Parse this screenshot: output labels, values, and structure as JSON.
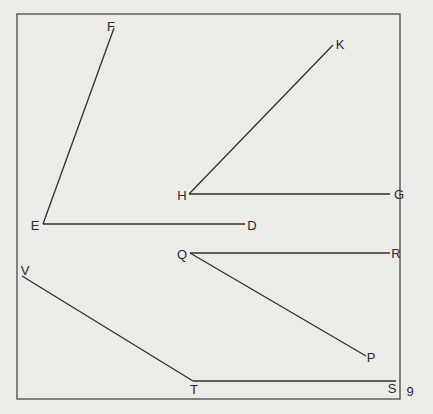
{
  "figure": {
    "page_number": "9",
    "frame": {
      "x1": 17,
      "y1": 14,
      "x2": 400,
      "y2": 399
    },
    "colors": {
      "background": "#ecebe8",
      "ink": "#2f2f2f",
      "frame": "#555555"
    },
    "angles": [
      {
        "name": "angle-FED",
        "vertex": "E",
        "arms": [
          "F",
          "D"
        ]
      },
      {
        "name": "angle-KHG",
        "vertex": "H",
        "arms": [
          "K",
          "G"
        ]
      },
      {
        "name": "angle-RQP",
        "vertex": "Q",
        "arms": [
          "R",
          "P"
        ]
      },
      {
        "name": "angle-VTS",
        "vertex": "T",
        "arms": [
          "V",
          "S"
        ]
      }
    ],
    "segments": [
      {
        "from": "E",
        "to": "F",
        "x1": 43,
        "y1": 224,
        "x2": 114,
        "y2": 28
      },
      {
        "from": "E",
        "to": "D",
        "x1": 43,
        "y1": 224,
        "x2": 245,
        "y2": 224
      },
      {
        "from": "H",
        "to": "K",
        "x1": 189,
        "y1": 194,
        "x2": 333,
        "y2": 45
      },
      {
        "from": "H",
        "to": "G",
        "x1": 189,
        "y1": 194,
        "x2": 390,
        "y2": 194
      },
      {
        "from": "Q",
        "to": "R",
        "x1": 190,
        "y1": 253,
        "x2": 390,
        "y2": 253
      },
      {
        "from": "Q",
        "to": "P",
        "x1": 190,
        "y1": 253,
        "x2": 366,
        "y2": 356
      },
      {
        "from": "T",
        "to": "V",
        "x1": 193,
        "y1": 381,
        "x2": 22,
        "y2": 276
      },
      {
        "from": "T",
        "to": "S",
        "x1": 193,
        "y1": 381,
        "x2": 396,
        "y2": 381
      }
    ],
    "labels": {
      "F": {
        "text": "F",
        "x": 111,
        "y": 26
      },
      "E": {
        "text": "E",
        "x": 35,
        "y": 225
      },
      "D": {
        "text": "D",
        "x": 252,
        "y": 225
      },
      "H": {
        "text": "H",
        "x": 182,
        "y": 195
      },
      "K": {
        "text": "K",
        "x": 340,
        "y": 44
      },
      "G": {
        "text": "G",
        "x": 399,
        "y": 194
      },
      "Q": {
        "text": "Q",
        "x": 182,
        "y": 254
      },
      "R": {
        "text": "R",
        "x": 396,
        "y": 253
      },
      "P": {
        "text": "P",
        "x": 371,
        "y": 357
      },
      "V": {
        "text": "V",
        "x": 25,
        "y": 270
      },
      "T": {
        "text": "T",
        "x": 194,
        "y": 389
      },
      "S": {
        "text": "S",
        "x": 392,
        "y": 388
      }
    }
  }
}
